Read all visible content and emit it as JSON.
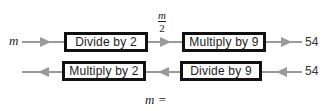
{
  "diagram": {
    "forward_row": {
      "input_label": "m",
      "steps": [
        {
          "label": "Divide by 2"
        },
        {
          "label": "Multiply by 9"
        }
      ],
      "intermediate": {
        "numerator": "m",
        "denominator": "2"
      },
      "output_value": "54"
    },
    "reverse_row": {
      "input_value": "54",
      "steps": [
        {
          "label": "Divide by 9"
        },
        {
          "label": "Multiply by 2"
        }
      ]
    },
    "answer_prompt": "m ="
  },
  "colors": {
    "box_border": "#111111",
    "arrow": "#9a9a9a",
    "text": "#1a1a1a"
  }
}
